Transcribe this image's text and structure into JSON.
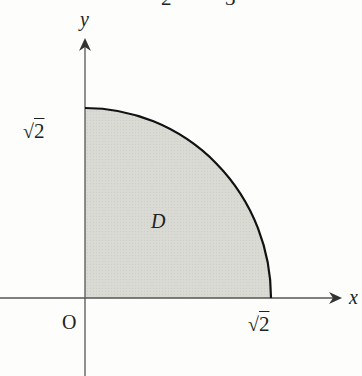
{
  "top_fragment": {
    "left": "2",
    "right": "3"
  },
  "axes": {
    "x_label": "x",
    "y_label": "y",
    "origin_label": "O"
  },
  "ticks": {
    "x_tick": {
      "radical": "√",
      "value": "2"
    },
    "y_tick": {
      "radical": "√",
      "value": "2"
    }
  },
  "region": {
    "label": "D",
    "shape": "quarter-disk, first quadrant, radius √2",
    "fill_color": "#d9d9d3",
    "edge_color": "#111111"
  },
  "colors": {
    "background": "#fdfdfb",
    "axis": "#555555",
    "text": "#222222"
  }
}
